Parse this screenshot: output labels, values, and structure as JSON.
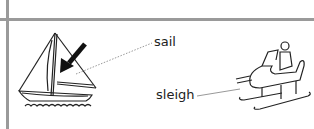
{
  "diagram": {
    "labels": [
      {
        "id": "sail",
        "text": "sail"
      },
      {
        "id": "sleigh",
        "text": "sleigh"
      }
    ],
    "illustrations": [
      {
        "name": "sailboat",
        "annotated_part": "sail",
        "arrow": "pointing at sail"
      },
      {
        "name": "sleigh",
        "has_rider": true
      }
    ],
    "colors": {
      "ink": "#222222",
      "rule": "#9a9a9a",
      "background": "#ffffff"
    }
  }
}
